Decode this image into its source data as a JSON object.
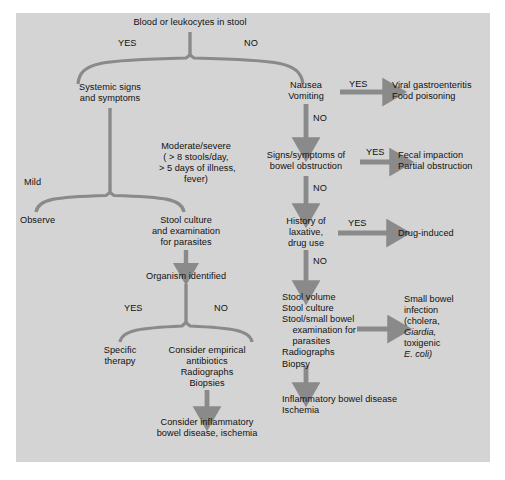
{
  "diagram": {
    "panel_color": "#d4d4d4",
    "line_color": "#8a8a8a",
    "text_color": "#111111"
  },
  "nodes": {
    "root": "Blood or leukocytes in stool",
    "root_yes": "YES",
    "root_no": "NO",
    "systemic": "Systemic signs\nand symptoms",
    "mild": "Mild",
    "observe": "Observe",
    "moderate": "Moderate/severe\n( > 8 stools/day,\n > 5 days of illness,\nfever)",
    "stool_culture": "Stool culture\nand examination\nfor parasites",
    "organism": "Organism identified",
    "organism_yes": "YES",
    "organism_no": "NO",
    "specific_therapy": "Specific\ntherapy",
    "consider_empirical": "Consider empirical\nantibiotics\nRadiographs\nBiopsies",
    "consider_ibd": "Consider inflammatory\nbowel disease, ischemia",
    "nausea": "Nausea\nVomiting",
    "nausea_yes": "YES",
    "nausea_no": "NO",
    "viral": "Viral gastroenteritis\nFood poisoning",
    "obstruction": "Signs/symptoms of\nbowel obstruction",
    "obstruction_yes": "YES",
    "obstruction_no": "NO",
    "fecal": "Fecal impaction\nPartial obstruction",
    "laxative": "History of\nlaxative,\ndrug use",
    "laxative_yes": "YES",
    "laxative_no": "NO",
    "drug_induced": "Drug-induced",
    "workup": "Stool volume\nStool culture\nStool/small bowel\n    examination for\n    parasites\nRadiographs\nBiopsy",
    "small_bowel_1": "Small bowel",
    "small_bowel_2": "infection",
    "small_bowel_3": "(cholera,",
    "small_bowel_4": "Giardia,",
    "small_bowel_5": "toxigenic",
    "small_bowel_6": "E. coli)",
    "ibd_ischemia": "Inflammatory bowel disease\nIschemia"
  }
}
